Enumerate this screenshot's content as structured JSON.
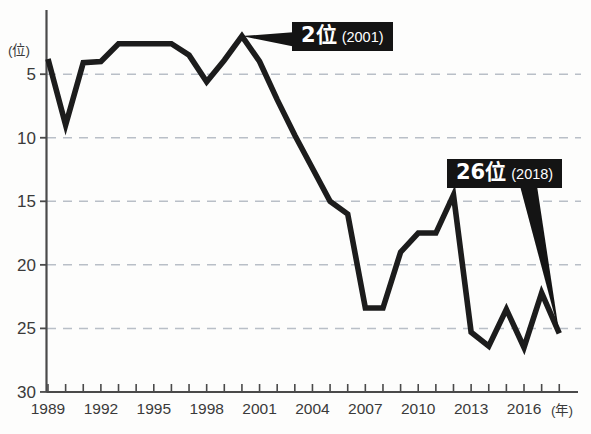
{
  "chart_data": {
    "type": "line",
    "title": "",
    "subtitle": "",
    "xlabel": "(年)",
    "ylabel": "(位)",
    "y_axis_inverted": true,
    "ylim": [
      1,
      30
    ],
    "xlim": [
      1989,
      2018
    ],
    "grid": "horizontal-dashed",
    "legend": "none",
    "y_ticks": [
      5,
      10,
      15,
      20,
      25,
      30
    ],
    "x_ticks_labeled": [
      "1989",
      "1992",
      "1995",
      "1998",
      "2001",
      "2004",
      "2007",
      "2010",
      "2013",
      "2016"
    ],
    "x_tick_step": 1,
    "x": [
      1989,
      1990,
      1991,
      1992,
      1993,
      1994,
      1995,
      1996,
      1997,
      1998,
      1999,
      2000,
      2001,
      2002,
      2003,
      2004,
      2005,
      2006,
      2007,
      2008,
      2009,
      2010,
      2011,
      2012,
      2013,
      2014,
      2015,
      2016,
      2017,
      2018
    ],
    "series": [
      {
        "name": "日本の順位",
        "values": [
          3.8,
          9.0,
          4.1,
          4.0,
          2.6,
          2.6,
          2.6,
          2.6,
          3.5,
          5.6,
          3.9,
          2.0,
          4.0,
          7.0,
          9.8,
          12.4,
          15.0,
          16.0,
          23.4,
          23.4,
          19.0,
          17.5,
          17.5,
          14.5,
          25.3,
          26.4,
          23.5,
          26.5,
          22.2,
          25.4
        ]
      }
    ],
    "annotations": [
      {
        "id": "peak",
        "rank_label": "2位",
        "year_label": "(2001)",
        "points_to_year": 2000,
        "points_to_value": 2.0
      },
      {
        "id": "latest",
        "rank_label": "26位",
        "year_label": "(2018)",
        "points_to_year": 2018,
        "points_to_value": 25.4
      }
    ],
    "colors": {
      "line": "#1c1c1c",
      "grid": "#b9bfc7",
      "axis": "#4a4a4a",
      "callout_bg": "#141414",
      "callout_text": "#ffffff",
      "background": "#fdfdfc"
    }
  },
  "axes": {
    "y_unit": "(位)",
    "x_unit": "(年)",
    "y_tick_labels": [
      "5",
      "10",
      "15",
      "20",
      "25",
      "30"
    ],
    "x_tick_labels": [
      "1989",
      "1992",
      "1995",
      "1998",
      "2001",
      "2004",
      "2007",
      "2010",
      "2013",
      "2016"
    ]
  },
  "callouts": {
    "peak": {
      "rank": "2位",
      "year": "(2001)"
    },
    "latest": {
      "rank": "26位",
      "year": "(2018)"
    }
  }
}
